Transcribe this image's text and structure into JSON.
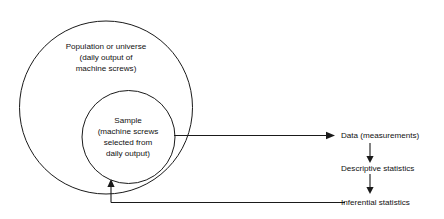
{
  "diagram": {
    "colors": {
      "stroke": "#1a1a1a",
      "text": "#111111",
      "background": "#ffffff"
    },
    "population": {
      "lines": [
        "Population or universe",
        "(daily output of",
        "machine screws)"
      ]
    },
    "sample": {
      "lines": [
        "Sample",
        "(machine screws",
        "selected from",
        "daily output)"
      ]
    },
    "stages": [
      {
        "label": "Data (measurements)"
      },
      {
        "label": "Descriptive statistics"
      },
      {
        "label": "Inferential statistics"
      }
    ]
  }
}
